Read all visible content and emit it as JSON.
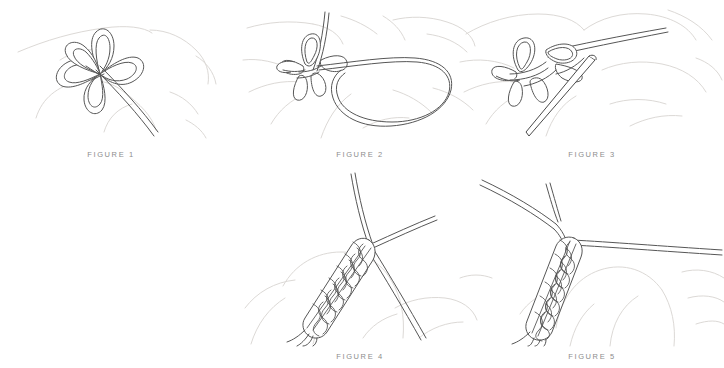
{
  "document": {
    "type": "instructional-diagram-sheet",
    "subject": "decorative braided cord knot tying steps",
    "background_color": "#ffffff",
    "cord_color": "#565656",
    "hand_outline_color": "#dcd9d6",
    "caption_color": "#8d8d8d"
  },
  "figures": [
    {
      "id": "figure-1",
      "caption": "FIGURE 1",
      "description": "Five-petal looped flower knot loosely formed with a single working cord trailing down to the lower right, held over a faint hand outline",
      "row": "top",
      "column": 1,
      "elements": [
        "five loop petals",
        "center crossing",
        "working end",
        "hand outline"
      ]
    },
    {
      "id": "figure-2",
      "caption": "FIGURE 2",
      "description": "Knot cluster gathered at left with a large open loop of cord sweeping out to the right and a standing end rising to the top",
      "row": "top",
      "column": 2,
      "elements": [
        "knot cluster",
        "large right loop",
        "standing end",
        "hand outline"
      ]
    },
    {
      "id": "figure-3",
      "caption": "FIGURE 3",
      "description": "Needle threaded diagonally down through the gathered loop knot, with the cord end sweeping up to the right",
      "row": "top",
      "column": 3,
      "elements": [
        "needle",
        "knot cluster",
        "cord tail",
        "hand outline"
      ]
    },
    {
      "id": "figure-4",
      "caption": "FIGURE 4",
      "description": "Tightened woven braid column angled up to the right, with one cord crossing steeply down to the lower right and a short tail exiting to the upper right",
      "row": "bottom",
      "column": 2,
      "elements": [
        "braided body",
        "crossing cord",
        "short tail",
        "hand outline"
      ]
    },
    {
      "id": "figure-5",
      "caption": "FIGURE 5",
      "description": "Finished braided knot body hanging from a bend in the cord, with a long horizontal cord running off to the right",
      "row": "bottom",
      "column": 3,
      "elements": [
        "braided body",
        "bent cord",
        "horizontal cord",
        "hand outline"
      ]
    }
  ]
}
